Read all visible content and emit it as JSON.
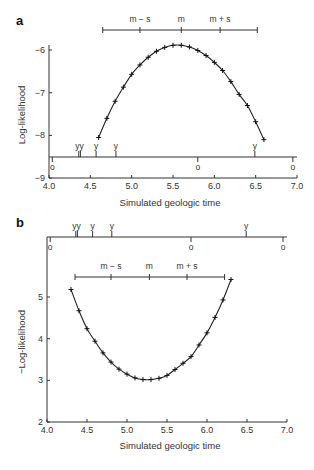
{
  "chart_data": [
    {
      "panel": "a",
      "type": "line",
      "xlabel": "Simulated geologic time",
      "ylabel": "Log-likelihood",
      "xlim": [
        4.0,
        7.0
      ],
      "ylim": [
        -9,
        -5.8
      ],
      "xticks": [
        "4.0",
        "4.5",
        "5.0",
        "5.5",
        "6.0",
        "6.5",
        "7.0"
      ],
      "yticks": [
        "-6",
        "-7",
        "-8",
        "-9"
      ],
      "grid": false,
      "series": [
        {
          "name": "Log-likelihood",
          "x": [
            4.6,
            4.7,
            4.8,
            4.9,
            5.0,
            5.1,
            5.2,
            5.3,
            5.4,
            5.5,
            5.6,
            5.7,
            5.8,
            5.9,
            6.0,
            6.1,
            6.2,
            6.3,
            6.4,
            6.5,
            6.6
          ],
          "y": [
            -8.05,
            -7.6,
            -7.2,
            -6.87,
            -6.57,
            -6.35,
            -6.17,
            -6.03,
            -5.94,
            -5.89,
            -5.89,
            -5.93,
            -6.01,
            -6.13,
            -6.29,
            -6.48,
            -6.74,
            -7.04,
            -7.3,
            -7.68,
            -8.1
          ]
        }
      ],
      "interval_bar": {
        "left": 4.65,
        "m_minus_s": 5.1,
        "m": 5.6,
        "m_plus_s": 6.07,
        "right": 6.52,
        "labels": [
          "m − s",
          "m",
          "m + s"
        ]
      },
      "y_events": [
        4.36,
        4.38,
        4.57,
        4.81,
        6.49
      ],
      "y_event_labels": [
        "y",
        "y",
        "y",
        "y",
        "y"
      ],
      "o_events": [
        4.04,
        5.8,
        6.95
      ],
      "o_event_labels": [
        "o",
        "o",
        "o"
      ]
    },
    {
      "panel": "b",
      "type": "line",
      "xlabel": "Simulated geologic time",
      "ylabel": "−Log-likelihood",
      "xlim": [
        4.0,
        7.0
      ],
      "ylim": [
        2,
        5.8
      ],
      "xticks": [
        "4.0",
        "4.5",
        "5.0",
        "5.5",
        "6.0",
        "6.5",
        "7.0"
      ],
      "yticks": [
        "2",
        "3",
        "4",
        "5"
      ],
      "grid": false,
      "series": [
        {
          "name": "-Log-likelihood",
          "x": [
            4.3,
            4.4,
            4.5,
            4.6,
            4.7,
            4.8,
            4.9,
            5.0,
            5.1,
            5.2,
            5.3,
            5.4,
            5.5,
            5.6,
            5.7,
            5.8,
            5.9,
            6.0,
            6.1,
            6.2,
            6.3
          ],
          "y": [
            5.18,
            4.67,
            4.24,
            3.94,
            3.66,
            3.44,
            3.27,
            3.15,
            3.06,
            3.02,
            3.02,
            3.05,
            3.12,
            3.26,
            3.41,
            3.57,
            3.85,
            4.14,
            4.51,
            4.93,
            5.42
          ]
        }
      ],
      "interval_bar": {
        "left": 4.35,
        "m_minus_s": 4.8,
        "m": 5.28,
        "m_plus_s": 5.75,
        "right": 6.22,
        "labels": [
          "m − s",
          "m",
          "m + s"
        ]
      },
      "y_events": [
        4.36,
        4.38,
        4.57,
        4.81,
        6.49
      ],
      "y_event_labels": [
        "y",
        "y",
        "y",
        "y",
        "y"
      ],
      "o_events": [
        4.04,
        5.8,
        6.95
      ],
      "o_event_labels": [
        "o",
        "o",
        "o"
      ]
    }
  ],
  "labels": {
    "panel_a": "a",
    "panel_b": "b",
    "a_xlabel": "Simulated geologic time",
    "a_ylabel": "Log-likelihood",
    "b_xlabel": "Simulated geologic time",
    "b_ylabel": "−Log-likelihood",
    "m_minus_s": "m − s",
    "m": "m",
    "m_plus_s": "m + s",
    "y_mark": "y",
    "o_mark": "o"
  }
}
